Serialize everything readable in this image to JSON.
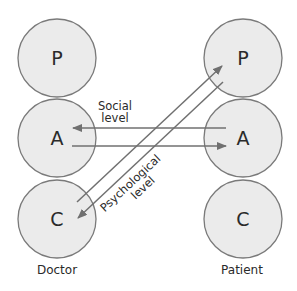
{
  "diagram": {
    "type": "transactional-analysis",
    "colors": {
      "circle_fill": "#ebebeb",
      "circle_stroke": "#7a7a7a",
      "line": "#707070",
      "text": "#2a2a2a"
    },
    "doctor": {
      "label": "Doctor",
      "states": [
        {
          "letter": "P",
          "name": "Parent"
        },
        {
          "letter": "A",
          "name": "Adult"
        },
        {
          "letter": "C",
          "name": "Child"
        }
      ]
    },
    "patient": {
      "label": "Patient",
      "states": [
        {
          "letter": "P",
          "name": "Parent"
        },
        {
          "letter": "A",
          "name": "Adult"
        },
        {
          "letter": "C",
          "name": "Child"
        }
      ]
    },
    "social_label": {
      "line1": "Social",
      "line2": "level"
    },
    "psychological_label": {
      "line1": "Psychological",
      "line2": "level"
    },
    "transactions": [
      {
        "level": "social",
        "from": "patient.A",
        "to": "doctor.A"
      },
      {
        "level": "social",
        "from": "doctor.A",
        "to": "patient.A"
      },
      {
        "level": "psychological",
        "from": "doctor.C",
        "to": "patient.P"
      },
      {
        "level": "psychological",
        "from": "patient.P",
        "to": "doctor.C"
      }
    ]
  }
}
